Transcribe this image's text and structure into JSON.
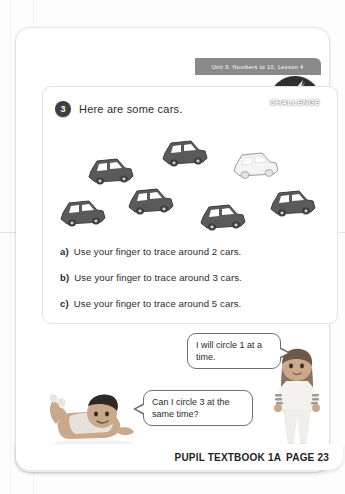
{
  "header": {
    "unit_banner": "Unit 3: Numbers to 10, Lesson 4"
  },
  "badge": {
    "challenge_label": "CHALLENGE",
    "icon": "lightning-bolt-icon"
  },
  "question": {
    "number": "3",
    "prompt": "Here are some cars."
  },
  "cars": {
    "total": 7,
    "items": [
      {
        "id": "car-1",
        "color": "#5a5a5a",
        "style": "dark"
      },
      {
        "id": "car-2",
        "color": "#5a5a5a",
        "style": "dark"
      },
      {
        "id": "car-3",
        "color": "#f2f2f2",
        "style": "light"
      },
      {
        "id": "car-4",
        "color": "#5a5a5a",
        "style": "dark"
      },
      {
        "id": "car-5",
        "color": "#5a5a5a",
        "style": "dark"
      },
      {
        "id": "car-6",
        "color": "#5a5a5a",
        "style": "dark"
      },
      {
        "id": "car-7",
        "color": "#5a5a5a",
        "style": "dark"
      }
    ]
  },
  "tasks": [
    {
      "label": "a)",
      "text": "Use your finger to trace around 2 cars."
    },
    {
      "label": "b)",
      "text": "Use your finger to trace around 3 cars."
    },
    {
      "label": "c)",
      "text": "Use your finger to trace around 5 cars."
    }
  ],
  "speech": {
    "girl": "I will circle 1 at a time.",
    "boy": "Can I circle 3 at the same time?"
  },
  "characters": {
    "boy_name": "boy-character",
    "girl_name": "girl-character"
  },
  "footer": {
    "page_number": "23",
    "practice_link": "→ Practice book 1A p15",
    "textbook_label": "PUPIL TEXTBOOK 1A",
    "page_label": "PAGE 23"
  },
  "colors": {
    "banner": "#8a8a8a",
    "badge": "#2f2f2f",
    "car_dark": "#5a5a5a",
    "car_light": "#f2f2f2",
    "text": "#2b2b2b"
  }
}
